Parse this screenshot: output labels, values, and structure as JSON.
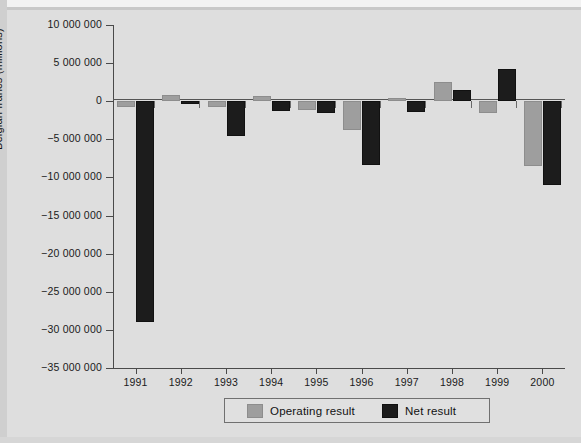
{
  "chart_data": {
    "type": "bar",
    "title": "",
    "xlabel": "",
    "ylabel": "Belgian francs (millions)",
    "categories": [
      "1991",
      "1992",
      "1993",
      "1994",
      "1995",
      "1996",
      "1997",
      "1998",
      "1999",
      "2000"
    ],
    "series": [
      {
        "name": "Operating result",
        "color": "#9e9e9e",
        "values": [
          -700000,
          800000,
          -800000,
          700000,
          -1200000,
          -3800000,
          400000,
          2500000,
          -1500000,
          -8500000
        ]
      },
      {
        "name": "Net result",
        "color": "#1c1c1c",
        "values": [
          -29000000,
          -400000,
          -4500000,
          -1300000,
          -1500000,
          -8400000,
          -1400000,
          1500000,
          4200000,
          -11000000
        ]
      }
    ],
    "ylim": [
      -35000000,
      10000000
    ],
    "ytick_values": [
      10000000,
      5000000,
      0,
      -5000000,
      -10000000,
      -15000000,
      -20000000,
      -25000000,
      -30000000,
      -35000000
    ],
    "ytick_labels": [
      "10 000 000",
      "5 000 000",
      "0",
      "−5 000 000",
      "−10 000 000",
      "−15 000 000",
      "−20 000 000",
      "−25 000 000",
      "−30 000 000",
      "−35 000 000"
    ],
    "grid": false,
    "legend_position": "bottom-center",
    "legend": [
      "Operating result",
      "Net result"
    ]
  },
  "legend": {
    "operating_label": "Operating result",
    "net_label": "Net result"
  },
  "axis": {
    "y_title": "Belgian francs (millions)"
  }
}
